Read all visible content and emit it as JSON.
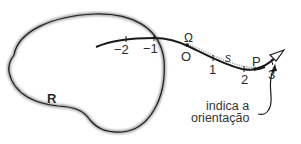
{
  "diagram": {
    "region": {
      "label": "R"
    },
    "curve": {
      "ticks": [
        {
          "label": "−2",
          "x": 126,
          "y": 39,
          "lx": 118,
          "ly": 54
        },
        {
          "label": "−1",
          "x": 154,
          "y": 38,
          "lx": 147,
          "ly": 53
        },
        {
          "label": "O",
          "x": 186,
          "y": 45,
          "lx": 181,
          "ly": 61
        },
        {
          "label": "1",
          "x": 213,
          "y": 58,
          "lx": 209,
          "ly": 73
        },
        {
          "label": "2",
          "x": 244,
          "y": 69,
          "lx": 240,
          "ly": 85
        },
        {
          "label": "3",
          "x": 272,
          "y": 62,
          "lx": 268,
          "ly": 78
        }
      ],
      "origin_symbol": "Ω",
      "arc_length_label": "s",
      "point_label": "P"
    },
    "annotation": {
      "line1": "indica a",
      "line2": "orientação"
    },
    "colors": {
      "ink": "#1a1a1a",
      "shade": "#9a9a9a",
      "background": "#ffffff"
    }
  }
}
